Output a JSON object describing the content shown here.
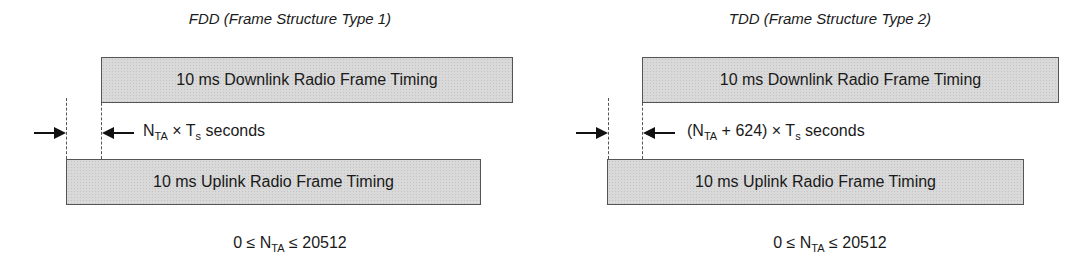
{
  "diagrams": [
    {
      "title": "FDD (Frame Structure Type 1)",
      "downlink_label": "10 ms Downlink Radio Frame Timing",
      "uplink_label": "10 ms Uplink Radio Frame Timing",
      "offset": {
        "prefix": "",
        "n": "N",
        "n_sub": "TA",
        "middle": " × T",
        "t_sub": "s",
        "suffix": " seconds"
      },
      "range": {
        "left": "0 ≤ N",
        "sub": "TA",
        "right": " ≤ 20512"
      }
    },
    {
      "title": "TDD (Frame Structure Type 2)",
      "downlink_label": "10 ms Downlink Radio Frame Timing",
      "uplink_label": "10 ms Uplink Radio Frame Timing",
      "offset": {
        "prefix": "(",
        "n": "N",
        "n_sub": "TA",
        "middle": " + 624) × T",
        "t_sub": "s",
        "suffix": " seconds"
      },
      "range": {
        "left": "0 ≤ N",
        "sub": "TA",
        "right": " ≤ 20512"
      }
    }
  ],
  "colors": {
    "box_fill": "#d9d9d9",
    "box_border": "#555555",
    "text": "#1a1a1a"
  }
}
